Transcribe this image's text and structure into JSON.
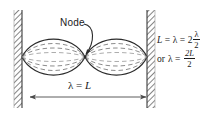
{
  "figure": {
    "background_color": "#ffffff",
    "line_color": "#1a1a1a",
    "wall_hatch_color": "#555555"
  },
  "annotations": {
    "node_label": "Node",
    "dimension_label_symbol": "λ",
    "dimension_label_equals": "=",
    "dimension_label_value": "L",
    "dimension_label_full": "λ = L"
  },
  "equations": [
    {
      "id": "equation-1",
      "text": "L = λ = 2 λ/2",
      "lhs": "L",
      "eq1": "=",
      "mid": "λ",
      "eq2": "=",
      "coefficient": "2",
      "fraction_numerator": "λ",
      "fraction_denominator": "2"
    },
    {
      "id": "equation-2",
      "text": "or λ = 2L/2",
      "prefix": "or",
      "lhs": "λ",
      "eq1": "=",
      "fraction_numerator": "2L",
      "fraction_denominator": "2"
    }
  ],
  "geometry": {
    "left_wall_x": 14,
    "right_wall_x": 147,
    "wall_thickness": 8,
    "axis_y": 57,
    "node_x": 85,
    "loop_count": 2,
    "dimension_line_y": 97
  }
}
